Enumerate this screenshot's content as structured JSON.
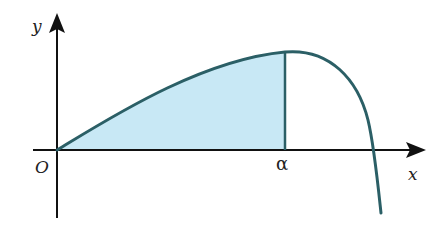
{
  "diagram": {
    "labels": {
      "y_axis": "y",
      "x_axis": "x",
      "origin": "O",
      "alpha": "α"
    },
    "colors": {
      "curve": "#2b5f66",
      "shade": "#c8e8f5",
      "axes": "#111111",
      "background": "#ffffff"
    },
    "elements": {
      "shaded_region": "area under curve from O to α",
      "vertical_line": "x = α"
    }
  }
}
